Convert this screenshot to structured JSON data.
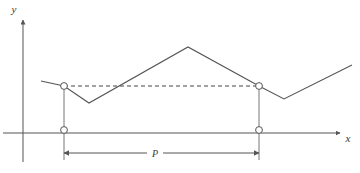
{
  "figure": {
    "kind": "line-plot",
    "title": "",
    "background_color": "#ffffff",
    "width": 360,
    "height": 173
  },
  "axes": {
    "x_axis": {
      "label": "x",
      "label_x": 348,
      "label_y": 142,
      "line_y": 133,
      "line_x_start": 3,
      "line_x_end": 340,
      "arrow": true,
      "color": "#555555"
    },
    "y_axis": {
      "label": "y",
      "label_x": 14,
      "label_y": 13,
      "line_x": 23,
      "line_y_start": 18,
      "line_y_end": 162,
      "arrow": true,
      "color": "#555555"
    }
  },
  "dimension": {
    "label": "P",
    "label_x": 155,
    "label_y": 157,
    "line_y": 153,
    "x_start": 64,
    "x_end": 259,
    "arrows": "both",
    "color": "#555555"
  },
  "markers": {
    "radius": 3.4,
    "fill": "#ffffff",
    "stroke": "#555555",
    "points": [
      {
        "name": "period-start-upper",
        "x": 64,
        "y": 86
      },
      {
        "name": "period-end-upper",
        "x": 259,
        "y": 86
      },
      {
        "name": "period-start-axis",
        "x": 64,
        "y": 130
      },
      {
        "name": "period-end-axis",
        "x": 259,
        "y": 130
      }
    ]
  },
  "drop_lines": [
    {
      "name": "left-drop-line",
      "x": 64,
      "y_top": 86,
      "y_bottom": 160
    },
    {
      "name": "right-drop-line",
      "x": 259,
      "y_top": 86,
      "y_bottom": 160
    }
  ],
  "dashed_level_line": {
    "name": "equal-level-dashed",
    "x_start": 64,
    "x_end": 259,
    "y": 86,
    "dash": "4 3",
    "color": "#444444"
  },
  "chart_data": {
    "type": "line",
    "title": "",
    "xlabel": "x",
    "ylabel": "y",
    "grid": false,
    "legend": null,
    "series": [
      {
        "name": "periodic-waveform",
        "color": "#555555",
        "points": [
          {
            "x": 41,
            "y": 81
          },
          {
            "x": 64,
            "y": 86
          },
          {
            "x": 89,
            "y": 103
          },
          {
            "x": 188,
            "y": 47
          },
          {
            "x": 259,
            "y": 86
          },
          {
            "x": 284,
            "y": 99
          },
          {
            "x": 352,
            "y": 65
          }
        ]
      }
    ],
    "annotations": [
      {
        "text": "P",
        "meaning": "period",
        "x": 155,
        "y": 157
      }
    ]
  }
}
